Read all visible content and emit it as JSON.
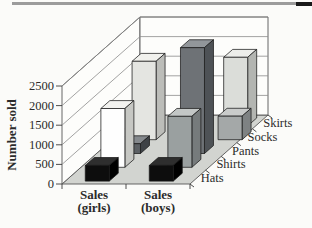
{
  "page": {
    "background": "#fbfbf9",
    "header_rule": {
      "color": "#9c9c9c",
      "accent_color": "#1a1a1a"
    }
  },
  "chart_data": {
    "type": "bar",
    "projection": "3d-oblique",
    "title": "",
    "ylabel": "Number sold",
    "ylim": [
      0,
      2500
    ],
    "yticks": [
      0,
      500,
      1000,
      1500,
      2000,
      2500
    ],
    "grid": true,
    "categories": [
      {
        "key": "girls",
        "label_lines": [
          "Sales",
          "(girls)"
        ]
      },
      {
        "key": "boys",
        "label_lines": [
          "Sales",
          "(boys)"
        ]
      }
    ],
    "depth_axis_labels": [
      "Hats",
      "Shirts",
      "Pants",
      "Socks",
      "Skirts"
    ],
    "series": [
      {
        "name": "Hats",
        "values": {
          "girls": 400,
          "boys": 400
        },
        "colors": {
          "girls": {
            "front": "#0d0d0d",
            "top": "#2e2e2e",
            "side": "#000000"
          },
          "boys": {
            "front": "#0d0d0d",
            "top": "#2e2e2e",
            "side": "#000000"
          }
        }
      },
      {
        "name": "Shirts",
        "values": {
          "girls": 1500,
          "boys": 1300
        },
        "colors": {
          "girls": {
            "front": "#fefefe",
            "top": "#f2f2ef",
            "side": "#c6c7c3"
          },
          "boys": {
            "front": "#9aa0a0",
            "top": "#c3c7c6",
            "side": "#767b7c"
          }
        }
      },
      {
        "name": "Pants",
        "values": {
          "girls": 250,
          "boys": 2700
        },
        "colors": {
          "girls": {
            "front": "#5c6064",
            "top": "#85898d",
            "side": "#3e4246"
          },
          "boys": {
            "front": "#6e7276",
            "top": "#92969a",
            "side": "#4e5256"
          }
        }
      },
      {
        "name": "Socks",
        "values": {
          "girls": 2000,
          "boys": 600
        },
        "colors": {
          "girls": {
            "front": "#e4e5e1",
            "top": "#f1f1ed",
            "side": "#bcbdb9"
          },
          "boys": {
            "front": "#a4a8a8",
            "top": "#c9cbca",
            "side": "#7e8283"
          }
        }
      },
      {
        "name": "Skirts",
        "values": {
          "girls": null,
          "boys": 1750
        },
        "colors": {
          "boys": {
            "front": "#dbddd9",
            "top": "#ecedea",
            "side": "#b3b5b1"
          }
        }
      }
    ],
    "wall_color": "#fdfdfb",
    "floor_color": "#d2d4d0",
    "gridline_color": "#8c8c8c",
    "outline_color": "#555555",
    "axis_color": "#3a3a3a",
    "text_color": "#2b2b2b"
  }
}
